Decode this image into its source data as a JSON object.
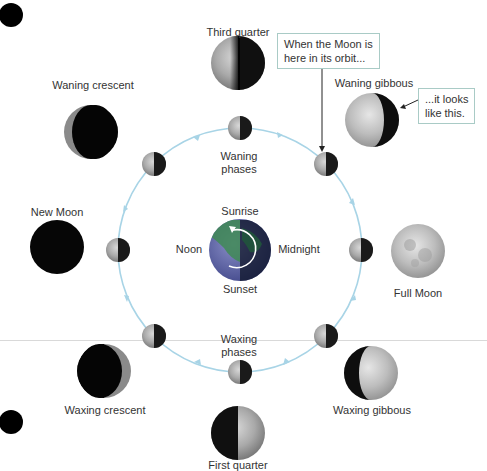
{
  "diagram": {
    "orbit_color": "#a8d4e6",
    "earth": {
      "time_labels": {
        "top": "Sunrise",
        "left": "Noon",
        "right": "Midnight",
        "bottom": "Sunset"
      }
    },
    "orbit_group_labels": {
      "waning": [
        "Waning",
        "phases"
      ],
      "waxing": [
        "Waxing",
        "phases"
      ]
    },
    "phases": [
      {
        "name": "Third quarter"
      },
      {
        "name": "Waning crescent"
      },
      {
        "name": "Waning gibbous"
      },
      {
        "name": "New Moon"
      },
      {
        "name": "Full Moon"
      },
      {
        "name": "Waxing crescent"
      },
      {
        "name": "Waxing gibbous"
      },
      {
        "name": "First quarter"
      }
    ],
    "callouts": {
      "orbit": [
        "When the Moon is",
        "here in its orbit..."
      ],
      "appearance": [
        "...it looks",
        "like this."
      ]
    }
  }
}
